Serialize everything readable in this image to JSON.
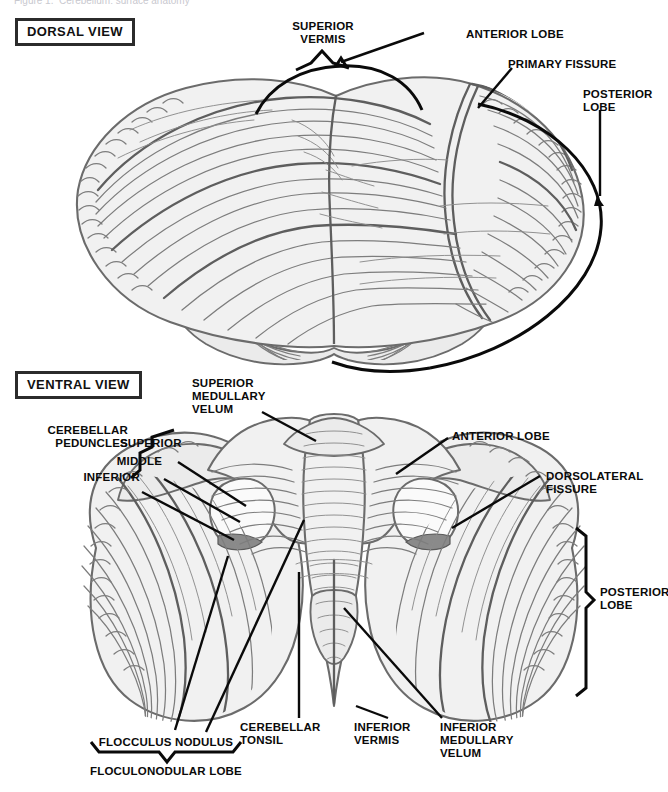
{
  "page": {
    "top_fragment": "Figure 1.  Cerebellum: surface anatomy",
    "bg_color": "#ffffff",
    "ink_color": "#0a0a0a",
    "tissue_fill": "#f1f1f1",
    "tissue_fill_shaded": "#dcdcdc",
    "tissue_line": "#7d7d7d",
    "tissue_outline": "#6b6b6b",
    "peduncle_cut": "#8a8a8a"
  },
  "dorsal": {
    "view_title": "DORSAL VIEW",
    "labels": {
      "superior_vermis": "SUPERIOR\nVERMIS",
      "anterior_lobe": "ANTERIOR LOBE",
      "primary_fissure": "PRIMARY FISSURE",
      "posterior_lobe": "POSTERIOR\nLOBE"
    }
  },
  "ventral": {
    "view_title": "VENTRAL VIEW",
    "labels": {
      "superior_medullary_velum": "SUPERIOR\nMEDULLARY\nVELUM",
      "cerebellar_peduncles": "CEREBELLAR\nPEDUNCLES",
      "peduncle_superior": "SUPERIOR",
      "peduncle_middle": "MIDDLE",
      "peduncle_inferior": "INFERIOR",
      "anterior_lobe": "ANTERIOR LOBE",
      "dorsolateral_fissure": "DORSOLATERAL\nFISSURE",
      "posterior_lobe": "POSTERIOR\nLOBE",
      "flocculus_nodulus": "FLOCCULUS NODULUS",
      "floculonodular_lobe": "FLOCULONODULAR LOBE",
      "cerebellar_tonsil": "CEREBELLAR\nTONSIL",
      "inferior_vermis": "INFERIOR\nVERMIS",
      "inferior_medullary_velum": "INFERIOR\nMEDULLARY\nVELUM"
    }
  }
}
